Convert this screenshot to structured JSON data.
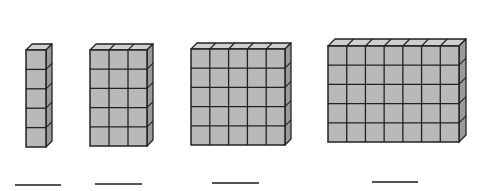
{
  "diagram": {
    "colors": {
      "front": "#b9b9b9",
      "top": "#cfcfcf",
      "side": "#9a9a9a",
      "edge": "#222222",
      "background": "#ffffff",
      "answer_line": "#555555"
    },
    "blocks": [
      {
        "id": 1,
        "columns": 1,
        "rows": 5,
        "layers": 1,
        "unit_cubes": 5,
        "x": 26,
        "y": 50,
        "w": 20,
        "h": 97,
        "depth": 6
      },
      {
        "id": 2,
        "columns": 3,
        "rows": 5,
        "layers": 1,
        "unit_cubes": 15,
        "x": 90,
        "y": 50,
        "w": 57,
        "h": 96,
        "depth": 6
      },
      {
        "id": 3,
        "columns": 5,
        "rows": 5,
        "layers": 1,
        "unit_cubes": 25,
        "x": 191,
        "y": 49,
        "w": 94,
        "h": 96,
        "depth": 6
      },
      {
        "id": 4,
        "columns": 7,
        "rows": 5,
        "layers": 1,
        "unit_cubes": 35,
        "x": 328,
        "y": 46,
        "w": 131,
        "h": 96,
        "depth": 7
      }
    ],
    "answer_lines": [
      {
        "for_block": 1,
        "x": 15,
        "y": 184,
        "w": 46,
        "value": ""
      },
      {
        "for_block": 2,
        "x": 95,
        "y": 183,
        "w": 47,
        "value": ""
      },
      {
        "for_block": 3,
        "x": 212,
        "y": 182,
        "w": 47,
        "value": ""
      },
      {
        "for_block": 4,
        "x": 372,
        "y": 181,
        "w": 46,
        "value": ""
      }
    ]
  }
}
